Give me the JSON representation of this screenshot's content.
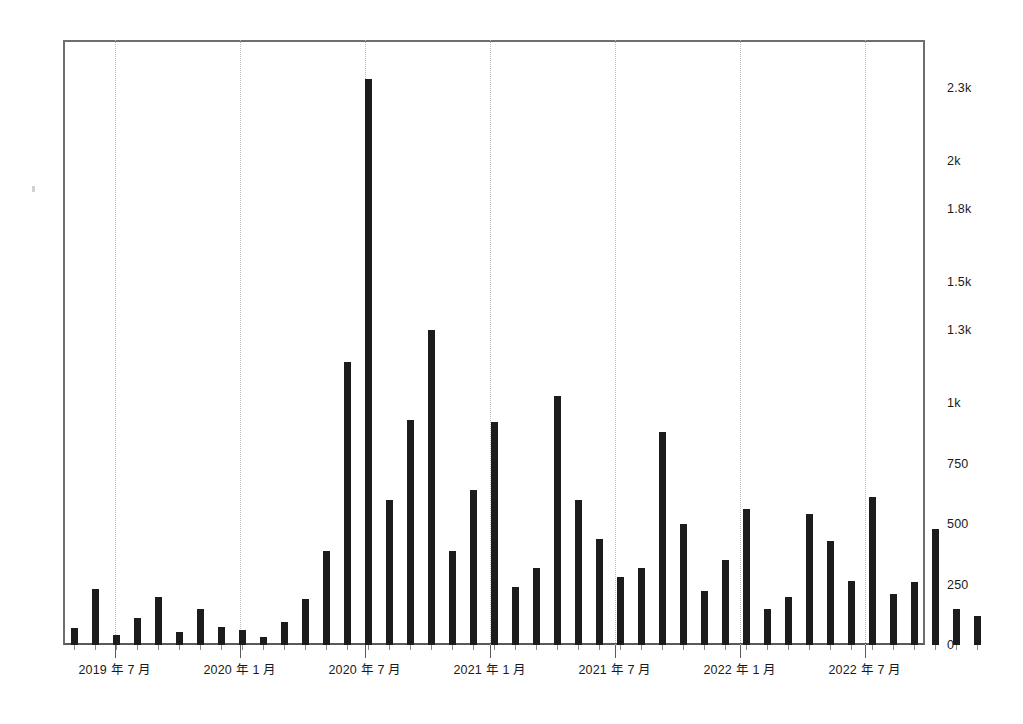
{
  "chart_data": {
    "type": "bar",
    "title": "",
    "subtitle": "",
    "xlabel": "",
    "ylabel": "",
    "grid": "vertical-dotted",
    "legend": "none",
    "ylim": [
      0,
      2500
    ],
    "y_ticks": [
      0,
      250,
      500,
      750,
      1000,
      1300,
      1500,
      1800,
      2000,
      2300
    ],
    "y_tick_labels": [
      "0",
      "250",
      "500",
      "750",
      "1k",
      "1.3k",
      "1.5k",
      "1.8k",
      "2k",
      "2.3k"
    ],
    "x_tick_labels": [
      "2019 年 7 月",
      "2020 年 1 月",
      "2020 年 7 月",
      "2021 年 1 月",
      "2021 年 7 月",
      "2022 年 1 月",
      "2022 年 7 月"
    ],
    "x_tick_positions": [
      115,
      240,
      365,
      490,
      615,
      740,
      865
    ],
    "bar_color": "#1c1c1c",
    "grid_color": "#b9b9b9",
    "axis_color": "#5a5a5a",
    "categories": [
      "2019-04",
      "2019-05",
      "2019-06",
      "2019-07",
      "2019-08",
      "2019-09",
      "2019-10",
      "2019-11",
      "2019-12",
      "2020-01",
      "2020-02",
      "2020-03",
      "2020-04",
      "2020-05",
      "2020-06",
      "2020-07",
      "2020-08",
      "2020-09",
      "2020-10",
      "2020-11",
      "2020-12",
      "2021-01",
      "2021-02",
      "2021-03",
      "2021-04",
      "2021-05",
      "2021-06",
      "2021-07",
      "2021-08",
      "2021-09",
      "2021-10",
      "2021-11",
      "2021-12",
      "2022-01",
      "2022-02",
      "2022-03",
      "2022-04",
      "2022-05",
      "2022-06",
      "2022-07",
      "2022-08",
      "2022-09",
      "2022-10",
      "2022-11"
    ],
    "values": [
      70,
      230,
      40,
      110,
      200,
      55,
      150,
      75,
      60,
      35,
      95,
      190,
      390,
      1170,
      2340,
      600,
      930,
      1300,
      390,
      640,
      920,
      240,
      320,
      1030,
      600,
      440,
      280,
      320,
      880,
      500,
      225,
      350,
      560,
      150,
      200,
      540,
      430,
      265,
      610,
      210,
      260,
      480,
      150,
      120
    ],
    "bar_x_positions": [
      71,
      92,
      113,
      134,
      155,
      176,
      197,
      218,
      239,
      260,
      281,
      302,
      323,
      344,
      365,
      386,
      407,
      428,
      449,
      470,
      491,
      512,
      533,
      554,
      575,
      596,
      617,
      638,
      659,
      680,
      701,
      722,
      743,
      764,
      785,
      806,
      827,
      848,
      869,
      890,
      911,
      932,
      953,
      974
    ],
    "bar_count": 44,
    "peak": {
      "category": "2020-06",
      "value": 2340
    }
  }
}
